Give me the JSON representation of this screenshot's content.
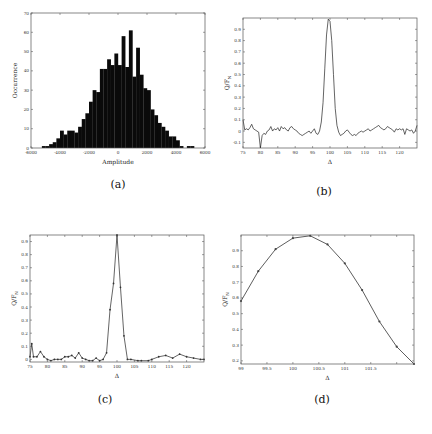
{
  "chart_data": [
    {
      "id": "a",
      "type": "bar",
      "caption": "(a)",
      "title": "",
      "xlabel": "Amplitude",
      "ylabel": "Occurrence",
      "xlim": [
        -6000,
        6000
      ],
      "ylim": [
        0,
        70
      ],
      "xticks": [
        -6000,
        -4000,
        -2000,
        0,
        2000,
        4000,
        6000
      ],
      "yticks": [
        0,
        10,
        20,
        30,
        40,
        50,
        60,
        70
      ],
      "bin_width": 250,
      "bin_starts": [
        -5250,
        -5000,
        -4750,
        -4500,
        -4250,
        -4000,
        -3750,
        -3500,
        -3250,
        -3000,
        -2750,
        -2500,
        -2250,
        -2000,
        -1750,
        -1500,
        -1250,
        -1000,
        -750,
        -500,
        -250,
        0,
        250,
        500,
        750,
        1000,
        1250,
        1500,
        1750,
        2000,
        2250,
        2500,
        2750,
        3000,
        3250,
        3500,
        3750,
        4000,
        4250,
        4500,
        4750,
        5000
      ],
      "values": [
        1,
        1,
        2,
        3,
        5,
        9,
        7,
        9,
        9,
        8,
        11,
        15,
        18,
        24,
        30,
        29,
        41,
        41,
        46,
        43,
        49,
        43,
        58,
        42,
        61,
        37,
        52,
        38,
        31,
        30,
        20,
        17,
        13,
        11,
        9,
        6,
        6,
        4,
        1,
        0,
        1,
        1
      ],
      "grid": false
    },
    {
      "id": "b",
      "type": "line",
      "caption": "(b)",
      "xlabel": "Δ",
      "ylabel": "Q/F_N",
      "xlim": [
        75,
        125
      ],
      "ylim": [
        -0.15,
        1.0
      ],
      "xticks": [
        75,
        80,
        85,
        90,
        95,
        100,
        105,
        110,
        115,
        120
      ],
      "yticks": [
        -0.1,
        0,
        0.1,
        0.2,
        0.3,
        0.4,
        0.5,
        0.6,
        0.7,
        0.8,
        0.9
      ],
      "x": [
        75,
        75.5,
        76,
        76.5,
        77,
        77.5,
        78,
        78.5,
        79,
        79.5,
        80,
        80.5,
        81,
        81.5,
        82,
        82.5,
        83,
        83.5,
        84,
        84.5,
        85,
        85.5,
        86,
        86.5,
        87,
        87.5,
        88,
        88.5,
        89,
        89.5,
        90,
        90.5,
        91,
        91.5,
        92,
        92.5,
        93,
        93.5,
        94,
        94.5,
        95,
        95.5,
        96,
        96.5,
        97,
        97.5,
        98,
        98.5,
        99,
        99.5,
        100,
        100.5,
        101,
        101.5,
        102,
        102.5,
        103,
        103.5,
        104,
        104.5,
        105,
        105.5,
        106,
        106.5,
        107,
        107.5,
        108,
        108.5,
        109,
        109.5,
        110,
        110.5,
        111,
        111.5,
        112,
        112.5,
        113,
        113.5,
        114,
        114.5,
        115,
        115.5,
        116,
        116.5,
        117,
        117.5,
        118,
        118.5,
        119,
        119.5,
        120,
        120.5,
        121,
        121.5,
        122,
        122.5,
        123,
        123.5,
        124,
        124.5,
        125
      ],
      "y": [
        0.1,
        0.01,
        0.02,
        0.01,
        0.03,
        0.06,
        0.02,
        0.01,
        0.0,
        -0.01,
        -0.15,
        -0.04,
        -0.02,
        -0.03,
        0.0,
        0.01,
        0.04,
        0.0,
        0.02,
        0.01,
        0.03,
        0.0,
        0.04,
        0.02,
        0.03,
        0.01,
        0.0,
        0.03,
        0.04,
        0.02,
        0.01,
        0.0,
        -0.02,
        -0.03,
        -0.04,
        -0.03,
        -0.02,
        -0.01,
        0.0,
        -0.02,
        0.0,
        0.02,
        -0.02,
        -0.03,
        0.0,
        0.08,
        0.25,
        0.55,
        0.85,
        0.99,
        0.97,
        0.8,
        0.5,
        0.2,
        0.05,
        -0.01,
        -0.04,
        -0.03,
        -0.02,
        0.0,
        0.01,
        -0.01,
        -0.03,
        -0.04,
        -0.03,
        -0.04,
        -0.02,
        -0.01,
        0.0,
        -0.01,
        0.0,
        0.01,
        0.02,
        0.0,
        0.01,
        0.02,
        0.03,
        0.04,
        0.05,
        0.03,
        0.02,
        0.01,
        0.02,
        0.04,
        0.03,
        0.02,
        0.01,
        -0.01,
        0.02,
        0.01,
        0.02,
        0.01,
        0.02,
        -0.03,
        0.02,
        0.01,
        0.0,
        0.01,
        -0.02,
        0.0,
        0.05
      ],
      "grid": false
    },
    {
      "id": "c",
      "type": "line",
      "caption": "(c)",
      "markers": true,
      "xlabel": "Δ",
      "ylabel": "Q/F_N",
      "xlim": [
        75,
        125
      ],
      "ylim": [
        -0.02,
        0.95
      ],
      "xticks": [
        75,
        80,
        85,
        90,
        95,
        100,
        105,
        110,
        115,
        120
      ],
      "yticks": [
        0,
        0.1,
        0.2,
        0.3,
        0.4,
        0.5,
        0.6,
        0.7,
        0.8,
        0.9
      ],
      "x": [
        75,
        75.5,
        76,
        77,
        78,
        79,
        80,
        81,
        82,
        83,
        84,
        85,
        86,
        87,
        88,
        89,
        90,
        91,
        92,
        93,
        94,
        95,
        96,
        97,
        98,
        99,
        100,
        101,
        102,
        103,
        104,
        106,
        107,
        109,
        110,
        112,
        114,
        116,
        118,
        120,
        122,
        124,
        125
      ],
      "y": [
        0.02,
        0.12,
        0.02,
        0.02,
        0.06,
        0.02,
        0.0,
        -0.01,
        0.0,
        0.0,
        0.0,
        0.02,
        0.02,
        0.03,
        0.01,
        0.05,
        0.01,
        0.0,
        -0.01,
        -0.01,
        0.01,
        -0.01,
        0.0,
        0.05,
        0.38,
        0.58,
        0.95,
        0.55,
        0.18,
        0.0,
        0.0,
        -0.01,
        -0.01,
        -0.01,
        0.0,
        0.02,
        0.03,
        0.01,
        0.04,
        0.02,
        0.01,
        0.0,
        0.0
      ],
      "grid": false
    },
    {
      "id": "d",
      "type": "line",
      "caption": "(d)",
      "markers": true,
      "xlabel": "Δ",
      "ylabel": "Q/F_N",
      "xlim": [
        99.9,
        101.9
      ],
      "ylim": [
        0.18,
        1.0
      ],
      "xticks": [
        99.9,
        100.2,
        100.5,
        100.8,
        101.1,
        101.4,
        101.7
      ],
      "xtick_labels": [
        "99",
        "99.5",
        "100",
        "100.5",
        "101",
        "101.5",
        ""
      ],
      "yticks": [
        0.2,
        0.3,
        0.4,
        0.5,
        0.6,
        0.7,
        0.8,
        0.9
      ],
      "x": [
        99.9,
        100.1,
        100.3,
        100.5,
        100.7,
        100.9,
        101.1,
        101.3,
        101.5,
        101.7,
        101.9
      ],
      "y": [
        0.58,
        0.77,
        0.91,
        0.98,
        0.995,
        0.94,
        0.82,
        0.65,
        0.45,
        0.29,
        0.18
      ],
      "grid": false
    }
  ],
  "captions": {
    "a": "(a)",
    "b": "(b)",
    "c": "(c)",
    "d": "(d)"
  }
}
